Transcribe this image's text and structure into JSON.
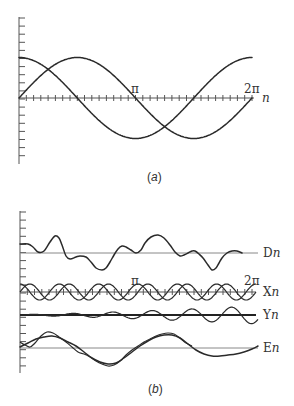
{
  "figure": {
    "panel_a": {
      "caption_open": "(",
      "caption_letter": "a",
      "caption_close": ")",
      "xaxis_var": "n",
      "tick_pi": "π",
      "tick_2pi": "2π"
    },
    "panel_b": {
      "caption_open": "(",
      "caption_letter": "b",
      "caption_close": ")",
      "tick_pi": "π",
      "tick_2pi": "2π",
      "trace_labels": [
        {
          "letter": "D",
          "var": "n"
        },
        {
          "letter": "X",
          "var": "n"
        },
        {
          "letter": "Y",
          "var": "n"
        },
        {
          "letter": "E",
          "var": "n"
        }
      ]
    }
  },
  "chart_data": [
    {
      "type": "line",
      "title": "(a)",
      "xlabel": "n",
      "ylabel": "",
      "xlim": [
        0,
        6.2832
      ],
      "ylim": [
        -1.6,
        2.0
      ],
      "x_ticks": [
        "π",
        "2π"
      ],
      "x_minor_ticks_per_pi": 16,
      "y_tick_spacing": 0.2,
      "grid": false,
      "series": [
        {
          "name": "cos n",
          "x": [
            0,
            0.785,
            1.571,
            2.356,
            3.142,
            3.927,
            4.712,
            5.498,
            6.283
          ],
          "values": [
            1,
            0.707,
            0,
            -0.707,
            -1,
            -0.707,
            0,
            0.707,
            1
          ]
        },
        {
          "name": "sin n",
          "x": [
            0,
            0.785,
            1.571,
            2.356,
            3.142,
            3.927,
            4.712,
            5.498,
            6.283
          ],
          "values": [
            0,
            0.707,
            1,
            0.707,
            0,
            -0.707,
            -1,
            -0.707,
            0
          ]
        }
      ]
    },
    {
      "type": "line",
      "title": "(b)",
      "xlabel": "",
      "ylabel": "",
      "xlim": [
        0,
        6.2832
      ],
      "x_ticks": [
        "π",
        "2π"
      ],
      "grid": false,
      "series": [
        {
          "name": "Dn",
          "baseline_y": 253,
          "points_px": [
            [
              20,
              244
            ],
            [
              28,
              244
            ],
            [
              33,
              247
            ],
            [
              38,
              252
            ],
            [
              44,
              251
            ],
            [
              50,
              242
            ],
            [
              55,
              236
            ],
            [
              59,
              238
            ],
            [
              62,
              245
            ],
            [
              66,
              256
            ],
            [
              70,
              259
            ],
            [
              76,
              257
            ],
            [
              80,
              256
            ],
            [
              86,
              257
            ],
            [
              91,
              262
            ],
            [
              96,
              268
            ],
            [
              102,
              270
            ],
            [
              106,
              268
            ],
            [
              110,
              262
            ],
            [
              114,
              255
            ],
            [
              118,
              249
            ],
            [
              122,
              246
            ],
            [
              126,
              247
            ],
            [
              131,
              250
            ],
            [
              136,
              253
            ],
            [
              141,
              250
            ],
            [
              145,
              243
            ],
            [
              151,
              237
            ],
            [
              158,
              235
            ],
            [
              164,
              238
            ],
            [
              170,
              245
            ],
            [
              175,
              252
            ],
            [
              180,
              256
            ],
            [
              184,
              255
            ],
            [
              188,
              253
            ],
            [
              192,
              251
            ],
            [
              195,
              251
            ],
            [
              199,
              254
            ],
            [
              203,
              258
            ],
            [
              208,
              265
            ],
            [
              212,
              270
            ],
            [
              216,
              268
            ],
            [
              219,
              263
            ],
            [
              222,
              258
            ],
            [
              227,
              253
            ],
            [
              232,
              251
            ],
            [
              237,
              251
            ],
            [
              242,
              253
            ]
          ]
        },
        {
          "name": "Xn (cos)",
          "baseline_y": 292,
          "amplitude_px": 8,
          "cycles": 6,
          "phase": 0
        },
        {
          "name": "Xn (sin)",
          "baseline_y": 292,
          "amplitude_px": 8,
          "cycles": 6,
          "phase": -1.5708
        },
        {
          "name": "Yn",
          "baseline_y": 315,
          "amplitude_start_px": 0.5,
          "amplitude_end_px": 9,
          "cycles": 6,
          "phase": 0
        },
        {
          "name": "En (smooth)",
          "baseline_y": 348,
          "points_px": [
            [
              20,
              347
            ],
            [
              28,
              343
            ],
            [
              36,
              339
            ],
            [
              44,
              337
            ],
            [
              52,
              336
            ],
            [
              60,
              338
            ],
            [
              68,
              342
            ],
            [
              76,
              346
            ],
            [
              84,
              352
            ],
            [
              92,
              358
            ],
            [
              100,
              362
            ],
            [
              108,
              364
            ],
            [
              116,
              363
            ],
            [
              124,
              358
            ],
            [
              132,
              352
            ],
            [
              140,
              346
            ],
            [
              148,
              341
            ],
            [
              156,
              337
            ],
            [
              164,
              335
            ],
            [
              172,
              335
            ],
            [
              180,
              338
            ],
            [
              188,
              344
            ],
            [
              196,
              350
            ],
            [
              204,
              354
            ],
            [
              212,
              356
            ],
            [
              220,
              356
            ],
            [
              228,
              355
            ],
            [
              236,
              354
            ],
            [
              244,
              352
            ],
            [
              252,
              349
            ],
            [
              258,
              346
            ]
          ]
        },
        {
          "name": "En (wiggly)",
          "baseline_y": 348,
          "points_px": [
            [
              20,
              342
            ],
            [
              25,
              345
            ],
            [
              30,
              347
            ],
            [
              35,
              343
            ],
            [
              41,
              336
            ],
            [
              47,
              332
            ],
            [
              53,
              333
            ],
            [
              59,
              337
            ],
            [
              66,
              342
            ],
            [
              72,
              347
            ],
            [
              78,
              352
            ],
            [
              84,
              354
            ],
            [
              90,
              357
            ],
            [
              96,
              361
            ],
            [
              102,
              364
            ],
            [
              108,
              366
            ],
            [
              114,
              365
            ],
            [
              120,
              361
            ],
            [
              126,
              355
            ],
            [
              132,
              350
            ],
            [
              138,
              346
            ],
            [
              144,
              342
            ],
            [
              150,
              339
            ],
            [
              156,
              336
            ],
            [
              162,
              334
            ],
            [
              168,
              333
            ],
            [
              174,
              334
            ],
            [
              180,
              338
            ],
            [
              186,
              343
            ],
            [
              192,
              346
            ]
          ]
        }
      ]
    }
  ]
}
